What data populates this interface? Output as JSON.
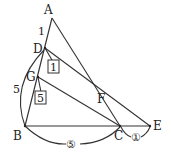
{
  "points": {
    "A": {
      "label": "A",
      "x": 52,
      "y": 18
    },
    "D": {
      "label": "D",
      "x": 45,
      "y": 48
    },
    "G": {
      "label": "G",
      "x": 38,
      "y": 77
    },
    "B": {
      "label": "B",
      "x": 25,
      "y": 126
    },
    "C": {
      "label": "C",
      "x": 120,
      "y": 126
    },
    "E": {
      "label": "E",
      "x": 150,
      "y": 126
    },
    "F": {
      "label": "F",
      "x": 93,
      "y": 105
    }
  },
  "annotations": {
    "ad_length": "1",
    "db_arc_length": "5",
    "boxed_top": "1",
    "boxed_bottom": "5",
    "bc_circled": "⑤",
    "ce_circled": "①"
  }
}
